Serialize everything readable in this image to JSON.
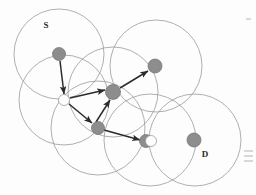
{
  "figure": {
    "type": "network-topology-diagram",
    "title": "",
    "width": 256,
    "height": 195,
    "background_color": "#fdfdfd",
    "labels": [
      {
        "name": "source-label",
        "text": "S",
        "x": 46,
        "y": 28
      },
      {
        "name": "destination-label",
        "text": "D",
        "x": 205,
        "y": 157
      }
    ],
    "colors": {
      "node_fill": "#8d8d8d",
      "node_stroke": "#6e6e6e",
      "circle_stroke": "#9a9a9a",
      "link_stroke": "#2b2b2b",
      "open_node_fill": "#ffffff"
    },
    "nodes": [
      {
        "id": "S",
        "label": "S",
        "x": 59,
        "y": 54,
        "r": 6.5,
        "kind": "filled"
      },
      {
        "id": "R1",
        "x": 64,
        "y": 100,
        "r": 5.5,
        "kind": "open"
      },
      {
        "id": "R2",
        "x": 113,
        "y": 92,
        "r": 7.5,
        "kind": "filled"
      },
      {
        "id": "R3",
        "x": 98,
        "y": 128,
        "r": 6.5,
        "kind": "filled"
      },
      {
        "id": "R4",
        "x": 155,
        "y": 66,
        "r": 7.0,
        "kind": "filled"
      },
      {
        "id": "R5",
        "x": 146,
        "y": 141,
        "r": 6.5,
        "kind": "filled"
      },
      {
        "id": "R5b",
        "x": 151,
        "y": 141,
        "r": 5.5,
        "kind": "open"
      },
      {
        "id": "D",
        "label": "D",
        "x": 194,
        "y": 140,
        "r": 7.0,
        "kind": "filled"
      }
    ],
    "coverage_circles": [
      {
        "name": "coverage-circle-s",
        "cx": 59,
        "cy": 54,
        "r": 45
      },
      {
        "name": "coverage-circle-r4",
        "cx": 156,
        "cy": 66,
        "r": 46
      },
      {
        "name": "coverage-circle-r1",
        "cx": 64,
        "cy": 100,
        "r": 45
      },
      {
        "name": "coverage-circle-r2",
        "cx": 113,
        "cy": 92,
        "r": 45
      },
      {
        "name": "coverage-circle-r3",
        "cx": 98,
        "cy": 128,
        "r": 47
      },
      {
        "name": "coverage-circle-r5",
        "cx": 150,
        "cy": 140,
        "r": 46
      },
      {
        "name": "coverage-circle-d",
        "cx": 195,
        "cy": 140,
        "r": 46
      }
    ],
    "links": [
      {
        "name": "link-s-to-r1",
        "from": "S",
        "to": "R1",
        "x1": 60,
        "y1": 61,
        "x2": 64,
        "y2": 94,
        "arrow": true
      },
      {
        "name": "link-r1-to-r2",
        "from": "R1",
        "to": "R2",
        "x1": 70,
        "y1": 98,
        "x2": 105,
        "y2": 90,
        "arrow": true
      },
      {
        "name": "link-r1-to-r3",
        "from": "R1",
        "to": "R3",
        "x1": 69,
        "y1": 104,
        "x2": 92,
        "y2": 123,
        "arrow": true
      },
      {
        "name": "link-r3-to-r2",
        "from": "R3",
        "to": "R2",
        "x1": 96,
        "y1": 122,
        "x2": 110,
        "y2": 100,
        "arrow": true
      },
      {
        "name": "link-r2-to-r4",
        "from": "R2",
        "to": "R4",
        "x1": 120,
        "y1": 88,
        "x2": 148,
        "y2": 71,
        "arrow": true
      },
      {
        "name": "link-r3-to-r5",
        "from": "R3",
        "to": "R5",
        "x1": 104,
        "y1": 130,
        "x2": 140,
        "y2": 140,
        "arrow": true
      }
    ]
  }
}
